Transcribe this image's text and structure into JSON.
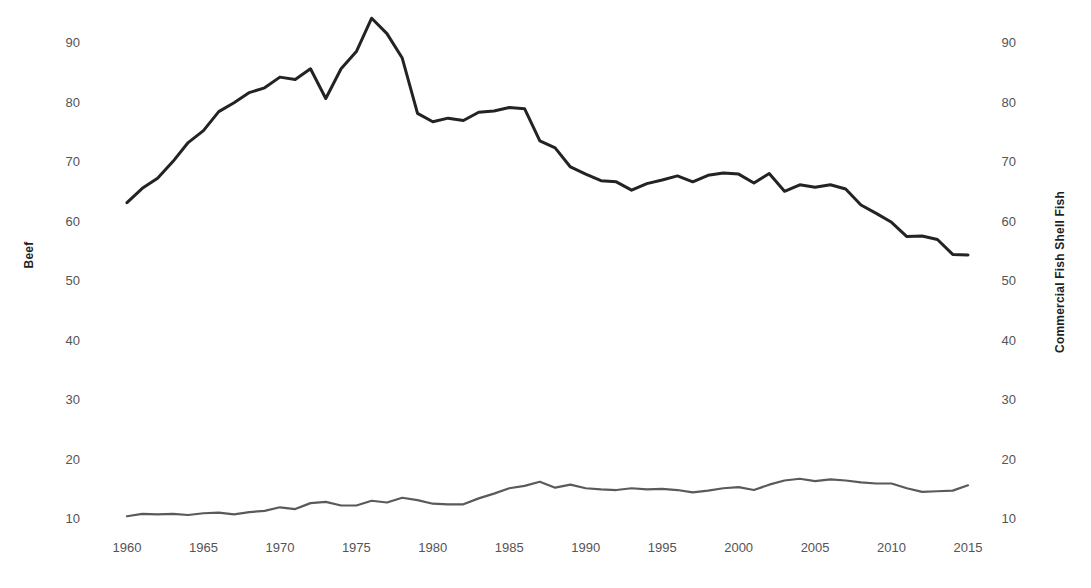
{
  "chart_data": {
    "type": "line",
    "title": "",
    "xlabel": "",
    "grid": false,
    "legend_position": "none",
    "x": [
      1960,
      1961,
      1962,
      1963,
      1964,
      1965,
      1966,
      1967,
      1968,
      1969,
      1970,
      1971,
      1972,
      1973,
      1974,
      1975,
      1976,
      1977,
      1978,
      1979,
      1980,
      1981,
      1982,
      1983,
      1984,
      1985,
      1986,
      1987,
      1988,
      1989,
      1990,
      1991,
      1992,
      1993,
      1994,
      1995,
      1996,
      1997,
      1998,
      1999,
      2000,
      2001,
      2002,
      2003,
      2004,
      2005,
      2006,
      2007,
      2008,
      2009,
      2010,
      2011,
      2012,
      2013,
      2014,
      2015
    ],
    "xlim": [
      1960,
      2015
    ],
    "xticks": [
      1960,
      1965,
      1970,
      1975,
      1980,
      1985,
      1990,
      1995,
      2000,
      2005,
      2010,
      2015
    ],
    "xticklabels": [
      "1960",
      "1965",
      "1970",
      "1975",
      "1980",
      "1985",
      "1990",
      "1995",
      "2000",
      "2005",
      "2010",
      "2015"
    ],
    "ylim": [
      6,
      96
    ],
    "yticks": [
      10,
      20,
      30,
      40,
      50,
      60,
      70,
      80,
      90
    ],
    "yticklabels": [
      "10",
      "20",
      "30",
      "40",
      "50",
      "60",
      "70",
      "80",
      "90"
    ],
    "left_axis": {
      "label": "Beef",
      "ticks": [
        10,
        20,
        30,
        40,
        50,
        60,
        70,
        80,
        90
      ],
      "ticklabels": [
        "10",
        "20",
        "30",
        "40",
        "50",
        "60",
        "70",
        "80",
        "90"
      ]
    },
    "right_axis": {
      "label": "Commercial Fish Shell Fish",
      "ticks": [
        10,
        20,
        30,
        40,
        50,
        60,
        70,
        80,
        90
      ],
      "ticklabels": [
        "10",
        "20",
        "30",
        "40",
        "50",
        "60",
        "70",
        "80",
        "90"
      ]
    },
    "series": [
      {
        "name": "Beef",
        "axis": "left",
        "color": "#232323",
        "width": 3.0,
        "values": [
          63.0,
          65.4,
          67.1,
          69.9,
          73.1,
          75.1,
          78.3,
          79.8,
          81.5,
          82.3,
          84.1,
          83.7,
          85.5,
          80.5,
          85.5,
          88.4,
          94.0,
          91.4,
          87.3,
          78.0,
          76.6,
          77.2,
          76.8,
          78.2,
          78.4,
          79.0,
          78.8,
          73.4,
          72.2,
          69.0,
          67.8,
          66.7,
          66.5,
          65.1,
          66.2,
          66.8,
          67.5,
          66.5,
          67.6,
          68.0,
          67.8,
          66.3,
          67.9,
          64.9,
          66.0,
          65.6,
          66.0,
          65.3,
          62.6,
          61.2,
          59.7,
          57.3,
          57.4,
          56.8,
          54.3,
          54.2
        ]
      },
      {
        "name": "Commercial Fish Shell Fish",
        "axis": "right",
        "color": "#5a5a5a",
        "width": 2.2,
        "values": [
          10.3,
          10.7,
          10.6,
          10.7,
          10.5,
          10.8,
          10.9,
          10.6,
          11.0,
          11.2,
          11.8,
          11.5,
          12.5,
          12.7,
          12.1,
          12.1,
          12.9,
          12.6,
          13.4,
          13.0,
          12.4,
          12.3,
          12.3,
          13.3,
          14.1,
          15.0,
          15.4,
          16.1,
          15.1,
          15.6,
          15.0,
          14.8,
          14.7,
          15.0,
          14.8,
          14.9,
          14.7,
          14.3,
          14.6,
          15.0,
          15.2,
          14.7,
          15.6,
          16.3,
          16.6,
          16.2,
          16.5,
          16.3,
          16.0,
          15.8,
          15.8,
          15.0,
          14.4,
          14.5,
          14.6,
          15.5
        ]
      }
    ]
  }
}
